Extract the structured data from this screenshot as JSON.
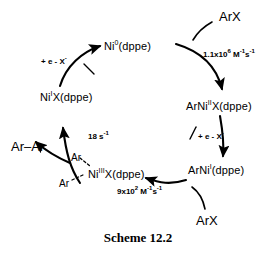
{
  "caption": "Scheme 12.2",
  "diagram": {
    "type": "catalytic-cycle",
    "title": "Scheme 12.2",
    "nodes": [
      {
        "id": "ni0",
        "label_pre": "Ni",
        "label_sup": "0",
        "label_post": "(dppe)",
        "x": 104,
        "y": 40
      },
      {
        "id": "arni2x",
        "label_pre": "ArNi",
        "label_sup": "II",
        "label_post": "X(dppe)",
        "x": 186,
        "y": 100
      },
      {
        "id": "arni1",
        "label_pre": "ArNi",
        "label_sup": "I",
        "label_post": "(dppe)",
        "x": 188,
        "y": 164
      },
      {
        "id": "ni3",
        "label_pre": "Ni",
        "label_sup": "III",
        "label_post": "X(dppe)",
        "x": 88,
        "y": 168
      },
      {
        "id": "ni1x",
        "label_pre": "Ni",
        "label_sup": "I",
        "label_post": "X(dppe)",
        "x": 40,
        "y": 91
      }
    ],
    "ligands": [
      {
        "id": "ar-top",
        "label": "Ar",
        "x": 71,
        "y": 152
      },
      {
        "id": "ar-bottom",
        "label": "Ar",
        "x": 59,
        "y": 178
      }
    ],
    "reagents": [
      {
        "id": "arx-top",
        "label": "ArX",
        "x": 219,
        "y": 9
      },
      {
        "id": "arx-bottom",
        "label": "ArX",
        "x": 196,
        "y": 213
      }
    ],
    "products": [
      {
        "id": "ar-ar",
        "label": "Ar–Ar",
        "x": 11,
        "y": 139
      }
    ],
    "rates": [
      {
        "id": "rate-oxidative-addition",
        "coefficient": "1.1x10",
        "exponent": "6",
        "units": " M",
        "units_sup": "-1",
        "units_tail": "s",
        "units_tail_sup": "-1",
        "x": 203,
        "y": 50
      },
      {
        "id": "rate-aryl-transfer",
        "coefficient": "9x10",
        "exponent": "2",
        "units": " M",
        "units_sup": "-1",
        "units_tail": "s",
        "units_tail_sup": "-1",
        "x": 117,
        "y": 187
      },
      {
        "id": "rate-reductive-elimination",
        "coefficient": "18 s",
        "exponent": "-1",
        "units": "",
        "units_sup": "",
        "units_tail": "",
        "units_tail_sup": "",
        "x": 88,
        "y": 132
      }
    ],
    "electron_transfers": [
      {
        "id": "et-left",
        "prefix": "+ e - X",
        "sup": "-",
        "x": 41,
        "y": 57
      },
      {
        "id": "et-right",
        "prefix": "+ e - X",
        "sup": "-",
        "x": 198,
        "y": 132
      }
    ],
    "colors": {
      "stroke": "#000000",
      "background": "#ffffff"
    }
  }
}
